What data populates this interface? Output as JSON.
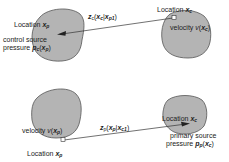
{
  "top_panel": {
    "control_region": {
      "location_label": "Location",
      "location_var": "x",
      "location_sub": "p",
      "source_label_line1": "control  source",
      "source_label_line2": "pressure",
      "pressure_var": "p",
      "pressure_sub": "c",
      "pressure_arg": "x",
      "pressure_arg_sub": "p"
    },
    "primary_region": {
      "location_label": "Location",
      "location_var": "x",
      "location_sub": "c",
      "velocity_label": "velocity",
      "velocity_var": "v",
      "velocity_arg": "x",
      "velocity_arg_sub": "c"
    },
    "transfer_label": {
      "func": "z",
      "func_sub": "c",
      "arg1": "x",
      "arg1_sub": "c",
      "arg2": "x",
      "arg2_sub": "p1"
    }
  },
  "bottom_panel": {
    "control_region": {
      "velocity_label": "velocity",
      "velocity_var": "v",
      "velocity_arg": "x",
      "velocity_arg_sub": "p",
      "location_label": "Location",
      "location_var": "x",
      "location_sub": "p"
    },
    "primary_region": {
      "location_label": "Location",
      "location_var": "x",
      "location_sub": "c",
      "source_label_line1": "primary  source",
      "source_label_line2": "pressure",
      "pressure_var": "p",
      "pressure_sub": "p",
      "pressure_arg": "x",
      "pressure_arg_sub": "c"
    },
    "transfer_label": {
      "func": "z",
      "func_sub": "p",
      "arg1": "x",
      "arg1_sub": "p",
      "arg2": "x",
      "arg2_sub": "c1"
    }
  },
  "colors": {
    "region_fill": "#b4b4b4",
    "region_stroke": "#555555",
    "line": "#333333"
  }
}
